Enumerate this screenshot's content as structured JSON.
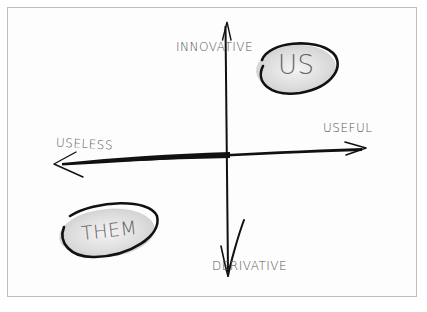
{
  "diagram": {
    "type": "2x2 quadrant",
    "axes": {
      "top": "INNOVATIVE",
      "bottom": "DERIVATIVE",
      "left": "USELESS",
      "right": "USEFUL"
    },
    "items": [
      {
        "label": "US",
        "quadrant": "innovative-useful"
      },
      {
        "label": "THEM",
        "quadrant": "derivative-useless"
      }
    ],
    "colors": {
      "stroke": "#111111",
      "text": "#555555",
      "blob_fill": "#dcdcdc",
      "frame": "#bdbdbd"
    }
  }
}
